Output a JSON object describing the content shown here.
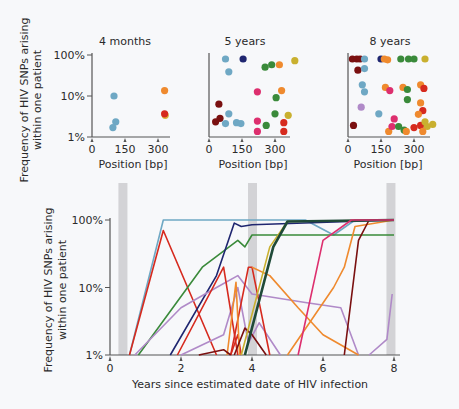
{
  "chart_data": [
    {
      "type": "scatter",
      "title": "4 months",
      "xlabel": "Position [bp]",
      "ylabel": "Frequency of HIV SNPs arising within one patient",
      "xticks": [
        "0",
        "150",
        "300"
      ],
      "yticks": [
        "1%",
        "10%",
        "100%"
      ],
      "yscale": "log",
      "xlim": [
        0,
        400
      ],
      "ylim": [
        1,
        100
      ],
      "points": [
        {
          "x": 100,
          "y": 10,
          "color": "#6fa8c4"
        },
        {
          "x": 108,
          "y": 2.0,
          "color": "#6fa8c4"
        },
        {
          "x": 95,
          "y": 1.4,
          "color": "#6fa8c4"
        },
        {
          "x": 330,
          "y": 14,
          "color": "#ef8a2e"
        },
        {
          "x": 333,
          "y": 3.0,
          "color": "#d9b43a"
        },
        {
          "x": 330,
          "y": 3.3,
          "color": "#d62a1e"
        }
      ]
    },
    {
      "type": "scatter",
      "title": "5 years",
      "xlabel": "Position [bp]",
      "xticks": [
        "0",
        "150",
        "300"
      ],
      "yticks": [
        "1%",
        "10%",
        "100%"
      ],
      "yscale": "log",
      "xlim": [
        0,
        400
      ],
      "ylim": [
        1,
        100
      ],
      "points": [
        {
          "x": 75,
          "y": 100,
          "color": "#6fa8c4"
        },
        {
          "x": 155,
          "y": 100,
          "color": "#1f2670"
        },
        {
          "x": 390,
          "y": 90,
          "color": "#c9b02f"
        },
        {
          "x": 255,
          "y": 60,
          "color": "#3a8a3a"
        },
        {
          "x": 285,
          "y": 70,
          "color": "#3a8a3a"
        },
        {
          "x": 320,
          "y": 70,
          "color": "#ef8a2e"
        },
        {
          "x": 90,
          "y": 45,
          "color": "#6fa8c4"
        },
        {
          "x": 220,
          "y": 13,
          "color": "#dd2f6e"
        },
        {
          "x": 330,
          "y": 14,
          "color": "#ef8a2e"
        },
        {
          "x": 305,
          "y": 9,
          "color": "#3a8a3a"
        },
        {
          "x": 45,
          "y": 6,
          "color": "#7a1010"
        },
        {
          "x": 90,
          "y": 3.3,
          "color": "#6fa8c4"
        },
        {
          "x": 300,
          "y": 3.3,
          "color": "#3a8a3a"
        },
        {
          "x": 360,
          "y": 3.0,
          "color": "#c9b02f"
        },
        {
          "x": 50,
          "y": 2.5,
          "color": "#7a1010"
        },
        {
          "x": 30,
          "y": 2.0,
          "color": "#7a1010"
        },
        {
          "x": 75,
          "y": 1.8,
          "color": "#6fa8c4"
        },
        {
          "x": 125,
          "y": 1.9,
          "color": "#6fa8c4"
        },
        {
          "x": 145,
          "y": 1.8,
          "color": "#6fa8c4"
        },
        {
          "x": 220,
          "y": 2.1,
          "color": "#dd2f6e"
        },
        {
          "x": 260,
          "y": 1.6,
          "color": "#3a8a3a"
        },
        {
          "x": 340,
          "y": 1.9,
          "color": "#d62a1e"
        },
        {
          "x": 220,
          "y": 1.1,
          "color": "#dd2f6e"
        },
        {
          "x": 340,
          "y": 1.1,
          "color": "#d62a1e"
        }
      ]
    },
    {
      "type": "scatter",
      "title": "8 years",
      "xlabel": "Position [bp]",
      "xticks": [
        "0",
        "150",
        "300"
      ],
      "yticks": [
        "1%",
        "10%",
        "100%"
      ],
      "yscale": "log",
      "xlim": [
        0,
        400
      ],
      "ylim": [
        1,
        100
      ],
      "points": [
        {
          "x": 20,
          "y": 100,
          "color": "#7a1010"
        },
        {
          "x": 40,
          "y": 100,
          "color": "#7a1010"
        },
        {
          "x": 55,
          "y": 100,
          "color": "#7a1010"
        },
        {
          "x": 75,
          "y": 100,
          "color": "#6fa8c4"
        },
        {
          "x": 150,
          "y": 100,
          "color": "#1f2670"
        },
        {
          "x": 165,
          "y": 100,
          "color": "#ef8a2e"
        },
        {
          "x": 180,
          "y": 95,
          "color": "#ef8a2e"
        },
        {
          "x": 240,
          "y": 100,
          "color": "#3a8a3a"
        },
        {
          "x": 275,
          "y": 100,
          "color": "#3a8a3a"
        },
        {
          "x": 300,
          "y": 100,
          "color": "#3a8a3a"
        },
        {
          "x": 350,
          "y": 100,
          "color": "#c9b02f"
        },
        {
          "x": 45,
          "y": 50,
          "color": "#7a1010"
        },
        {
          "x": 75,
          "y": 55,
          "color": "#6fa8c4"
        },
        {
          "x": 65,
          "y": 20,
          "color": "#6fa8c4"
        },
        {
          "x": 75,
          "y": 13,
          "color": "#6fa8c4"
        },
        {
          "x": 170,
          "y": 17,
          "color": "#ef8a2e"
        },
        {
          "x": 190,
          "y": 14,
          "color": "#dd2f6e"
        },
        {
          "x": 250,
          "y": 17,
          "color": "#ef8a2e"
        },
        {
          "x": 270,
          "y": 15,
          "color": "#3a8a3a"
        },
        {
          "x": 330,
          "y": 20,
          "color": "#ef8a2e"
        },
        {
          "x": 345,
          "y": 16,
          "color": "#d62a1e"
        },
        {
          "x": 270,
          "y": 8,
          "color": "#3a8a3a"
        },
        {
          "x": 330,
          "y": 6.5,
          "color": "#ef8a2e"
        },
        {
          "x": 60,
          "y": 5,
          "color": "#b08ac8"
        },
        {
          "x": 140,
          "y": 3.3,
          "color": "#6fa8c4"
        },
        {
          "x": 340,
          "y": 4,
          "color": "#d62a1e"
        },
        {
          "x": 320,
          "y": 3.2,
          "color": "#ef8a2e"
        },
        {
          "x": 210,
          "y": 2.4,
          "color": "#dd2f6e"
        },
        {
          "x": 25,
          "y": 1.6,
          "color": "#7a1010"
        },
        {
          "x": 185,
          "y": 1.1,
          "color": "#ef8a2e"
        },
        {
          "x": 200,
          "y": 1.5,
          "color": "#dd2f6e"
        },
        {
          "x": 230,
          "y": 1.5,
          "color": "#3a8a3a"
        },
        {
          "x": 255,
          "y": 1.2,
          "color": "#3a8a3a"
        },
        {
          "x": 265,
          "y": 1.1,
          "color": "#ef8a2e"
        },
        {
          "x": 300,
          "y": 1.4,
          "color": "#d62a1e"
        },
        {
          "x": 330,
          "y": 1.6,
          "color": "#d62a1e"
        },
        {
          "x": 350,
          "y": 2.0,
          "color": "#c9b02f"
        },
        {
          "x": 360,
          "y": 1.5,
          "color": "#c9b02f"
        },
        {
          "x": 385,
          "y": 1.7,
          "color": "#c9b02f"
        },
        {
          "x": 340,
          "y": 1.1,
          "color": "#ef8a2e"
        }
      ]
    },
    {
      "type": "line",
      "title": "",
      "xlabel": "Years since estimated date of HIV infection",
      "ylabel": "Frequency of HIV SNPs arising within one patient",
      "xticks": [
        "0",
        "2",
        "4",
        "6",
        "8"
      ],
      "yticks": [
        "1%",
        "10%",
        "100%"
      ],
      "yscale": "log",
      "xlim": [
        0,
        8
      ],
      "ylim": [
        1,
        100
      ],
      "shaded_timepoints": [
        0.35,
        4.0,
        7.9
      ],
      "series": [
        {
          "name": "teal",
          "color": "#6fa8c4",
          "x": [
            0.55,
            1.5,
            4.0,
            5.5,
            6.3,
            6.9,
            8.0
          ],
          "y": [
            1,
            100,
            100,
            100,
            60,
            100,
            100
          ]
        },
        {
          "name": "red-early",
          "color": "#d62a1e",
          "x": [
            0.55,
            1.5,
            3.0
          ],
          "y": [
            1,
            70,
            1
          ]
        },
        {
          "name": "green",
          "color": "#3a8a3a",
          "x": [
            0.8,
            2.6,
            3.6,
            3.8,
            4.0,
            8.0
          ],
          "y": [
            1,
            20,
            50,
            40,
            60,
            60
          ]
        },
        {
          "name": "navy",
          "color": "#1f2670",
          "x": [
            1.7,
            3.0,
            3.5,
            3.7,
            4.0,
            8.0
          ],
          "y": [
            1,
            15,
            90,
            80,
            85,
            100
          ]
        },
        {
          "name": "lilac",
          "color": "#b08ac8",
          "x": [
            0.7,
            2.0,
            3.0,
            3.6,
            4.0,
            5.5,
            6.5,
            7.0
          ],
          "y": [
            1,
            5,
            10,
            15,
            8,
            6,
            5,
            1
          ]
        },
        {
          "name": "lilac2",
          "color": "#b08ac8",
          "x": [
            2.0,
            3.2,
            3.6,
            3.9,
            4.2,
            4.8
          ],
          "y": [
            1,
            2,
            10,
            1.5,
            3,
            1
          ]
        },
        {
          "name": "red-mid1",
          "color": "#d62a1e",
          "x": [
            1.9,
            3.2,
            3.6
          ],
          "y": [
            1,
            20,
            1
          ]
        },
        {
          "name": "red-mid2",
          "color": "#d62a1e",
          "x": [
            3.4,
            3.9,
            4.0,
            4.5
          ],
          "y": [
            1,
            20,
            20,
            1
          ]
        },
        {
          "name": "red-small",
          "color": "#d62a1e",
          "x": [
            3.4,
            3.6,
            3.7
          ],
          "y": [
            1,
            2,
            1
          ]
        },
        {
          "name": "orange-spike",
          "color": "#ef8a2e",
          "x": [
            3.3,
            3.55,
            3.65
          ],
          "y": [
            1,
            12,
            1
          ]
        },
        {
          "name": "orange",
          "color": "#ef8a2e",
          "x": [
            4.0,
            4.5,
            5.3,
            6.0,
            7.0
          ],
          "y": [
            20,
            15,
            5,
            2,
            1
          ]
        },
        {
          "name": "orange2",
          "color": "#ef8a2e",
          "x": [
            5.0,
            6.3,
            6.6,
            6.9,
            8.0
          ],
          "y": [
            1,
            10,
            20,
            80,
            100
          ]
        },
        {
          "name": "darkred",
          "color": "#7a1010",
          "x": [
            2.5,
            3.2,
            3.4
          ],
          "y": [
            1,
            1.2,
            1
          ]
        },
        {
          "name": "darkred2",
          "color": "#7a1010",
          "x": [
            3.5,
            3.8,
            4.0,
            4.4
          ],
          "y": [
            1,
            2.5,
            2,
            1
          ]
        },
        {
          "name": "darkred3",
          "color": "#7a1010",
          "x": [
            6.6,
            7.0,
            7.3,
            8.0
          ],
          "y": [
            1,
            50,
            100,
            100
          ]
        },
        {
          "name": "olive",
          "color": "#c9b02f",
          "x": [
            3.7,
            4.5,
            5.0,
            8.0
          ],
          "y": [
            1,
            40,
            95,
            100
          ]
        },
        {
          "name": "darkgreen-thick",
          "color": "#1f4a38",
          "x": [
            3.8,
            4.6,
            5.0,
            8.0
          ],
          "y": [
            1,
            40,
            95,
            100
          ]
        },
        {
          "name": "magenta",
          "color": "#dd2f6e",
          "x": [
            5.3,
            6.0,
            6.8,
            8.0
          ],
          "y": [
            1,
            50,
            100,
            100
          ]
        },
        {
          "name": "lilac3",
          "color": "#b08ac8",
          "x": [
            7.3,
            7.8,
            7.95
          ],
          "y": [
            1,
            1.7,
            8
          ]
        }
      ]
    }
  ],
  "panels": {
    "p1": {
      "title": "4 months",
      "xlabel": "Position [bp]"
    },
    "p2": {
      "title": "5 years",
      "xlabel": "Position [bp]"
    },
    "p3": {
      "title": "8 years",
      "xlabel": "Position [bp]"
    }
  },
  "top_ylabel_line1": "Frequency of HIV SNPs arising",
  "top_ylabel_line2": "within one patient",
  "bottom_ylabel_line1": "Frequency of HIV SNPs arising",
  "bottom_ylabel_line2": "within one patient",
  "bottom_xlabel": "Years since estimated date of HIV infection",
  "yticks": [
    "1%",
    "10%",
    "100%"
  ],
  "pos_ticks": [
    "0",
    "150",
    "300"
  ],
  "year_ticks": [
    "0",
    "2",
    "4",
    "6",
    "8"
  ]
}
